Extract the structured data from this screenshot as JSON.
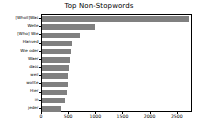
{
  "chart_data": {
    "type": "bar",
    "orientation": "horizontal",
    "title": "Top Non-Stopwords",
    "xlabel": "",
    "ylabel": "",
    "categories": [
      "[Wholl]Was",
      "Welle",
      "[Who] Wie",
      "Hanved",
      "Wie oder",
      "Waer",
      "dass",
      "weil",
      "wollte",
      "Hier",
      "in",
      "jeder"
    ],
    "values": [
      2700,
      980,
      700,
      560,
      540,
      510,
      490,
      480,
      470,
      455,
      430,
      350
    ],
    "xlim": [
      0,
      2780
    ],
    "xticks": [
      0,
      500,
      1000,
      1500,
      2000,
      2500
    ],
    "xticklabels": [
      "0",
      "500",
      "1000",
      "1500",
      "2000",
      "2500"
    ],
    "grid": false,
    "bar_color": "#808080",
    "background": "#ffffff",
    "frame_color": "#000000"
  }
}
